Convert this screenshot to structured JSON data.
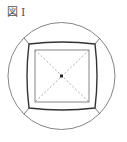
{
  "figure": {
    "label_prefix": "図",
    "label_number": "I"
  },
  "colors": {
    "line": "#555555",
    "thick_line": "#333333",
    "dashed": "#888888",
    "center": "#222222"
  }
}
